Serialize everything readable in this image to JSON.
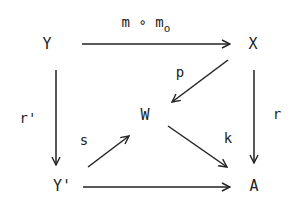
{
  "diagram": {
    "type": "commutative-diagram",
    "colors": {
      "ink": "#222222",
      "background": "#ffffff"
    },
    "nodes": [
      {
        "id": "Y",
        "label": "Y",
        "x": 47,
        "y": 44
      },
      {
        "id": "X",
        "label": "X",
        "x": 253,
        "y": 44
      },
      {
        "id": "W",
        "label": "W",
        "x": 145,
        "y": 115
      },
      {
        "id": "Yp",
        "label": "Y'",
        "x": 62,
        "y": 186
      },
      {
        "id": "A",
        "label": "A",
        "x": 254,
        "y": 186
      }
    ],
    "edges": [
      {
        "from": "Y",
        "to": "X",
        "label": "m ∘ m",
        "label_sub": "o",
        "x1": 82,
        "y1": 44,
        "x2": 230,
        "y2": 44
      },
      {
        "from": "X",
        "to": "W",
        "label": "p",
        "x1": 228,
        "y1": 60,
        "x2": 172,
        "y2": 102
      },
      {
        "from": "Y",
        "to": "Yp",
        "label": "r'",
        "x1": 56,
        "y1": 70,
        "x2": 56,
        "y2": 165
      },
      {
        "from": "X",
        "to": "A",
        "label": "r",
        "x1": 254,
        "y1": 70,
        "x2": 254,
        "y2": 163
      },
      {
        "from": "Yp",
        "to": "W",
        "label": "s",
        "x1": 88,
        "y1": 167,
        "x2": 129,
        "y2": 136
      },
      {
        "from": "W",
        "to": "A",
        "label": "k",
        "x1": 168,
        "y1": 126,
        "x2": 227,
        "y2": 167
      },
      {
        "from": "Yp",
        "to": "A",
        "label": "",
        "x1": 83,
        "y1": 187,
        "x2": 230,
        "y2": 187
      }
    ],
    "labels": {
      "mm0": {
        "text": "m ∘ m",
        "sub": "o",
        "x": 146,
        "y": 22
      },
      "p": {
        "text": "p",
        "x": 180,
        "y": 72
      },
      "rp": {
        "text": "r'",
        "x": 28,
        "y": 118
      },
      "s": {
        "text": "s",
        "x": 84,
        "y": 140
      },
      "k": {
        "text": "k",
        "x": 228,
        "y": 138
      },
      "r": {
        "text": "r",
        "x": 277,
        "y": 114
      }
    }
  }
}
